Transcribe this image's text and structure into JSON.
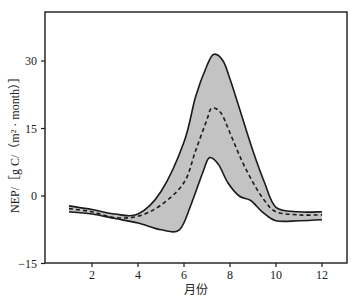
{
  "chart_data": {
    "type": "area",
    "title": "",
    "xlabel": "月份",
    "ylabel": "NEP/［g C/（m² · month）］",
    "xlim": [
      0,
      13
    ],
    "ylim": [
      -15,
      40
    ],
    "xticks": [
      2,
      4,
      6,
      8,
      10,
      12
    ],
    "yticks": [
      -15,
      0,
      15,
      30
    ],
    "grid": false,
    "legend": null,
    "series": [
      {
        "name": "upper bound",
        "style": "solid",
        "x": [
          1,
          2,
          3,
          4,
          5,
          6,
          6.5,
          7,
          7.3,
          7.7,
          8,
          8.5,
          9,
          9.5,
          10,
          11,
          12
        ],
        "values": [
          -2.2,
          -3,
          -4,
          -4,
          1,
          12,
          22,
          29,
          31.5,
          30,
          26,
          18,
          10,
          3,
          -2.5,
          -3.5,
          -3.5
        ]
      },
      {
        "name": "mean",
        "style": "dashed",
        "x": [
          1,
          2,
          3,
          4,
          5,
          6,
          6.5,
          7,
          7.2,
          7.6,
          8,
          8.5,
          9,
          9.5,
          10,
          11,
          12
        ],
        "values": [
          -2.8,
          -3.5,
          -4.8,
          -4.5,
          -2,
          3,
          10,
          17,
          19.5,
          18.5,
          14,
          8,
          3,
          -1,
          -3.5,
          -4.2,
          -4.2
        ]
      },
      {
        "name": "lower bound",
        "style": "solid",
        "x": [
          1,
          2,
          3,
          4,
          5,
          5.8,
          6.3,
          6.8,
          7.1,
          7.5,
          7.9,
          8.4,
          8.9,
          9.4,
          10,
          11,
          12
        ],
        "values": [
          -3.5,
          -4,
          -5,
          -6,
          -7.5,
          -7.5,
          -2,
          5,
          8.5,
          7,
          3,
          0,
          -1,
          -3.5,
          -5.5,
          -5.5,
          -5.3
        ]
      }
    ]
  },
  "plot": {
    "band_fill": "#c3c3c3",
    "line_color": "#1a1a1a"
  }
}
